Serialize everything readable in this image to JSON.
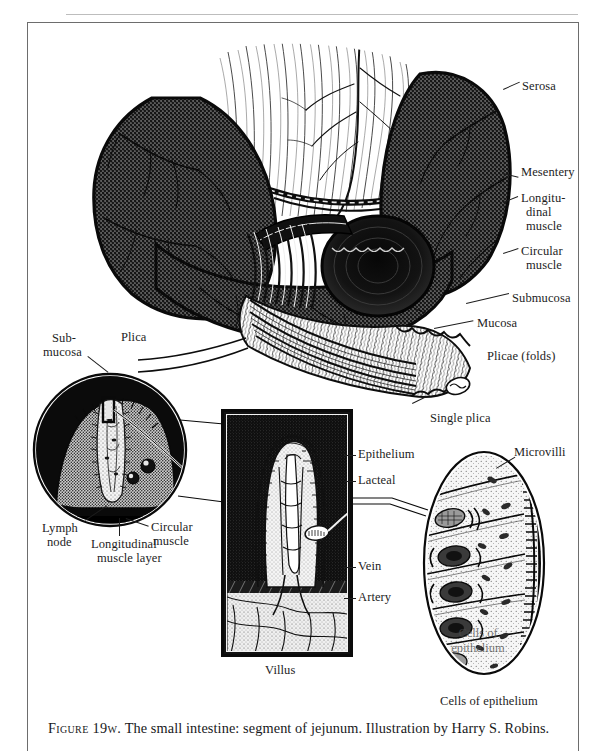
{
  "figure": {
    "caption_figno": "Figure 19w.",
    "caption_text": " The small intestine: segment of jejunum. Illustration by Harry S. Robins.",
    "caption_full": "Figure 19w. The small intestine: segment of jejunum. Illustration by Harry S. Robins."
  },
  "main_diagram": {
    "title": "small-intestine-segment-of-jejunum",
    "labels": {
      "serosa": "Serosa",
      "mesentery": "Mesentery",
      "longitudinal_muscle_l1": "Longitu-",
      "longitudinal_muscle_l2": "dinal",
      "longitudinal_muscle_l3": "muscle",
      "circular_muscle_l1": "Circular",
      "circular_muscle_l2": "muscle",
      "submucosa": "Submucosa",
      "mucosa": "Mucosa",
      "plicae_folds": "Plicae (folds)",
      "single_plica": "Single plica"
    }
  },
  "plica_inset": {
    "name": "circular-plica-cross-section-inset",
    "labels": {
      "submucosa_l1": "Sub-",
      "submucosa_l2": "mucosa",
      "plica": "Plica",
      "lymph_node_l1": "Lymph",
      "lymph_node_l2": "node",
      "longitudinal_muscle_layer_l1": "Longitudinal",
      "longitudinal_muscle_layer_l2": "muscle layer",
      "circular_muscle_l1": "Circular",
      "circular_muscle_l2": "muscle"
    }
  },
  "villus_panel": {
    "name": "villus-cross-section-panel",
    "caption": "Villus",
    "labels": {
      "epithelium": "Epithelium",
      "lacteal": "Lacteal",
      "vein": "Vein",
      "artery": "Artery"
    }
  },
  "epithelium_inset": {
    "name": "epithelial-cells-oval-inset",
    "labels": {
      "microvilli": "Microvilli",
      "cells_of_epithelium": "Cells of epithelium",
      "overlay_l1": "Cells of",
      "overlay_l2": "epithelium"
    }
  },
  "colors": {
    "ink": "#1d1d1d",
    "frame": "#6d6d6d",
    "hairline": "#bdbdbd",
    "panel_bg": "#121212",
    "paper": "#ffffff"
  }
}
